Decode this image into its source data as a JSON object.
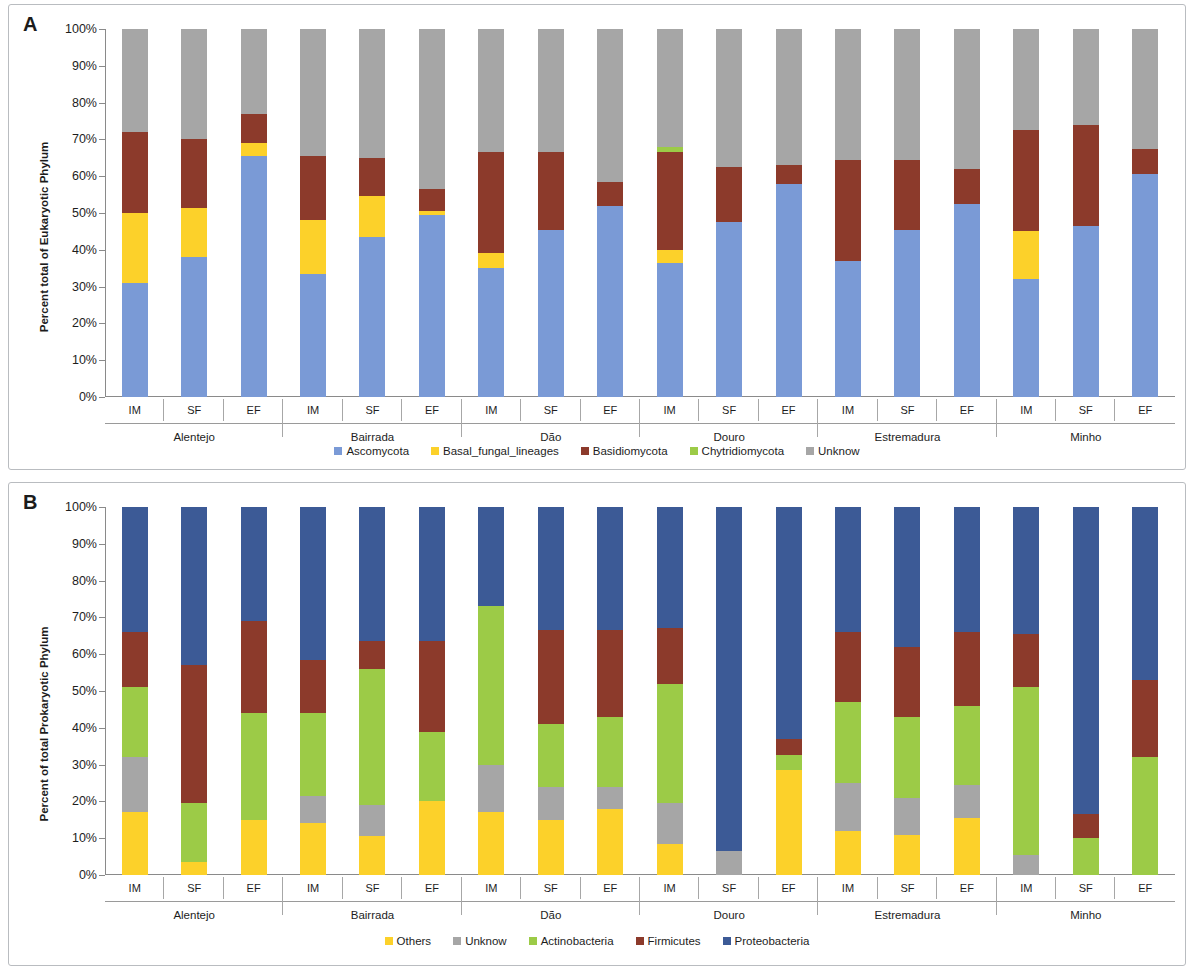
{
  "panels": [
    {
      "letter": "A",
      "ylabel": "Percent total of Eukaryotic Phylum",
      "chart_key": "eukaryotic"
    },
    {
      "letter": "B",
      "ylabel": "Percent of total Prokaryotic Phylum",
      "chart_key": "prokaryotic"
    }
  ],
  "axis": {
    "ticks": [
      "100%",
      "90%",
      "80%",
      "70%",
      "60%",
      "50%",
      "40%",
      "30%",
      "20%",
      "10%",
      "0%"
    ],
    "regions": [
      "Alentejo",
      "Bairrada",
      "Dão",
      "Douro",
      "Estremadura",
      "Minho"
    ],
    "samples": [
      "IM",
      "SF",
      "EF"
    ]
  },
  "chart_data": [
    {
      "id": "eukaryotic",
      "type": "bar",
      "stacked": true,
      "title": "A",
      "xlabel": "",
      "ylabel": "Percent total of Eukaryotic Phylum",
      "ylim": [
        0,
        100
      ],
      "ytick_labels": [
        "0%",
        "10%",
        "20%",
        "30%",
        "40%",
        "50%",
        "60%",
        "70%",
        "80%",
        "90%",
        "100%"
      ],
      "grid": false,
      "legend_position": "bottom",
      "categories": [
        "Alentejo IM",
        "Alentejo SF",
        "Alentejo EF",
        "Bairrada IM",
        "Bairrada SF",
        "Bairrada EF",
        "Dão IM",
        "Dão SF",
        "Dão EF",
        "Douro IM",
        "Douro SF",
        "Douro EF",
        "Estremadura IM",
        "Estremadura SF",
        "Estremadura EF",
        "Minho IM",
        "Minho SF",
        "Minho EF"
      ],
      "groups": [
        {
          "region": "Alentejo",
          "samples": [
            "IM",
            "SF",
            "EF"
          ]
        },
        {
          "region": "Bairrada",
          "samples": [
            "IM",
            "SF",
            "EF"
          ]
        },
        {
          "region": "Dão",
          "samples": [
            "IM",
            "SF",
            "EF"
          ]
        },
        {
          "region": "Douro",
          "samples": [
            "IM",
            "SF",
            "EF"
          ]
        },
        {
          "region": "Estremadura",
          "samples": [
            "IM",
            "SF",
            "EF"
          ]
        },
        {
          "region": "Minho",
          "samples": [
            "IM",
            "SF",
            "EF"
          ]
        }
      ],
      "series": [
        {
          "name": "Ascomycota",
          "color": "#7a9ad6",
          "values": [
            31,
            38,
            65.5,
            33.5,
            43.5,
            49.5,
            35,
            45.5,
            52,
            36.5,
            47.5,
            58,
            37,
            45.5,
            52.5,
            32,
            46.5,
            60.5
          ]
        },
        {
          "name": "Basal_fungal_lineages",
          "color": "#fcd12a",
          "values": [
            19,
            13.5,
            3.5,
            14.5,
            11,
            1,
            4,
            0,
            0,
            3.5,
            0,
            0,
            0,
            0,
            0,
            13,
            0,
            0
          ]
        },
        {
          "name": "Basidiomycota",
          "color": "#8c3a2b",
          "values": [
            22,
            18.5,
            8,
            17.5,
            10.5,
            6,
            27.5,
            21,
            6.5,
            26.5,
            15,
            5,
            27.5,
            19,
            9.5,
            27.5,
            27.5,
            7
          ]
        },
        {
          "name": "Chytridiomycota",
          "color": "#9ccb47",
          "values": [
            0,
            0,
            0,
            0,
            0,
            0,
            0,
            0,
            0,
            1.5,
            0,
            0,
            0,
            0,
            0,
            0,
            0,
            0
          ]
        },
        {
          "name": "Unknow",
          "color": "#a6a6a6",
          "values": [
            28,
            30,
            23,
            34.5,
            35,
            43.5,
            33.5,
            33.5,
            41.5,
            32,
            37.5,
            37,
            35.5,
            35.5,
            38,
            27.5,
            26,
            32.5
          ]
        }
      ],
      "legend": [
        "Ascomycota",
        "Basal_fungal_lineages",
        "Basidiomycota",
        "Chytridiomycota",
        "Unknow"
      ]
    },
    {
      "id": "prokaryotic",
      "type": "bar",
      "stacked": true,
      "title": "B",
      "xlabel": "",
      "ylabel": "Percent of total Prokaryotic Phylum",
      "ylim": [
        0,
        100
      ],
      "ytick_labels": [
        "0%",
        "10%",
        "20%",
        "30%",
        "40%",
        "50%",
        "60%",
        "70%",
        "80%",
        "90%",
        "100%"
      ],
      "grid": false,
      "legend_position": "bottom",
      "categories": [
        "Alentejo IM",
        "Alentejo SF",
        "Alentejo EF",
        "Bairrada IM",
        "Bairrada SF",
        "Bairrada EF",
        "Dão IM",
        "Dão SF",
        "Dão EF",
        "Douro IM",
        "Douro SF",
        "Douro EF",
        "Estremadura IM",
        "Estremadura SF",
        "Estremadura EF",
        "Minho IM",
        "Minho SF",
        "Minho EF"
      ],
      "groups": [
        {
          "region": "Alentejo",
          "samples": [
            "IM",
            "SF",
            "EF"
          ]
        },
        {
          "region": "Bairrada",
          "samples": [
            "IM",
            "SF",
            "EF"
          ]
        },
        {
          "region": "Dão",
          "samples": [
            "IM",
            "SF",
            "EF"
          ]
        },
        {
          "region": "Douro",
          "samples": [
            "IM",
            "SF",
            "EF"
          ]
        },
        {
          "region": "Estremadura",
          "samples": [
            "IM",
            "SF",
            "EF"
          ]
        },
        {
          "region": "Minho",
          "samples": [
            "IM",
            "SF",
            "EF"
          ]
        }
      ],
      "series": [
        {
          "name": "Others",
          "color": "#fcd12a",
          "values": [
            17,
            3.5,
            15,
            14,
            10.5,
            20,
            17,
            15,
            18,
            8.5,
            0,
            28.5,
            12,
            11,
            15.5,
            0,
            0,
            0
          ]
        },
        {
          "name": "Unknow",
          "color": "#a6a6a6",
          "values": [
            15,
            0,
            0,
            7.5,
            8.5,
            0,
            13,
            9,
            6,
            11,
            6.5,
            0,
            13,
            10,
            9,
            5.5,
            0,
            0
          ]
        },
        {
          "name": "Actinobacteria",
          "color": "#9ccb47",
          "values": [
            19,
            16,
            29,
            22.5,
            37,
            19,
            43,
            17,
            19,
            32.5,
            0,
            4,
            22,
            22,
            21.5,
            45.5,
            10,
            32
          ]
        },
        {
          "name": "Firmicutes",
          "color": "#8c3a2b",
          "values": [
            15,
            37.5,
            25,
            14.5,
            7.5,
            24.5,
            0,
            25.5,
            23.5,
            15,
            0,
            4.5,
            19,
            19,
            20,
            14.5,
            6.5,
            21
          ]
        },
        {
          "name": "Proteobacteria",
          "color": "#3c5a96",
          "values": [
            34,
            43,
            31,
            41.5,
            36.5,
            36.5,
            27,
            33.5,
            33.5,
            33,
            93.5,
            63,
            34,
            38,
            34,
            34.5,
            83.5,
            47
          ]
        }
      ],
      "legend": [
        "Others",
        "Unknow",
        "Actinobacteria",
        "Firmicutes",
        "Proteobacteria"
      ]
    }
  ]
}
